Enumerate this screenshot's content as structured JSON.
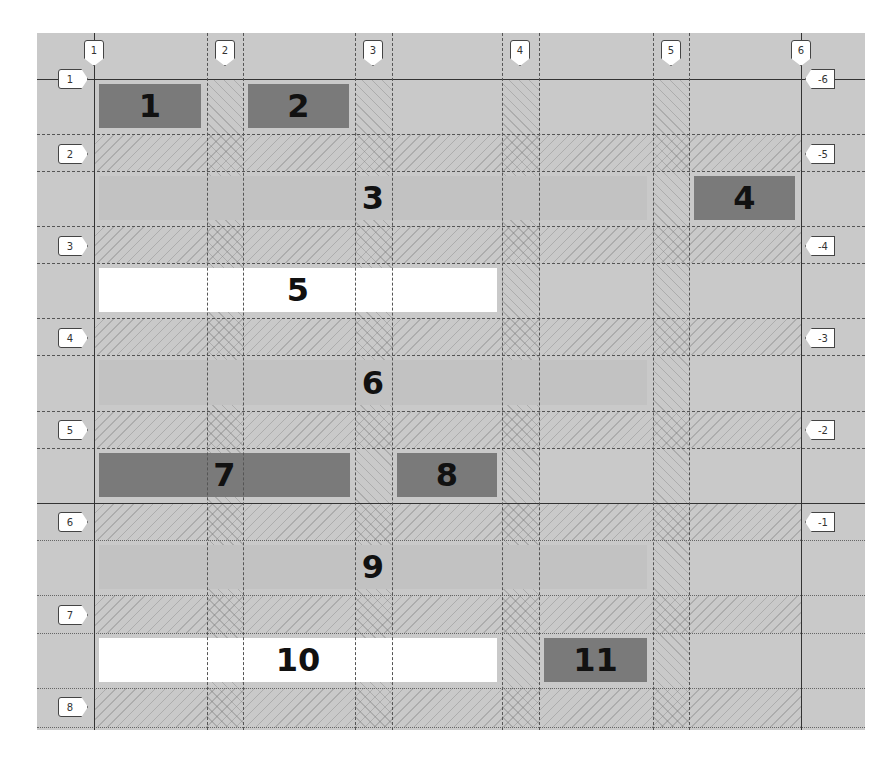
{
  "inspector": {
    "title": "CSS Grid Inspector Overlay",
    "column_line_labels": [
      "1",
      "2",
      "3",
      "4",
      "5",
      "6"
    ],
    "row_line_labels": [
      "1",
      "2",
      "3",
      "4",
      "5",
      "6",
      "7",
      "8"
    ],
    "negative_row_line_labels": [
      "-6",
      "-5",
      "-4",
      "-3",
      "-2",
      "-1"
    ]
  },
  "grid_items": [
    {
      "label": "1",
      "tone": "dark"
    },
    {
      "label": "2",
      "tone": "dark"
    },
    {
      "label": "3",
      "tone": "mid"
    },
    {
      "label": "4",
      "tone": "dark"
    },
    {
      "label": "5",
      "tone": "light"
    },
    {
      "label": "6",
      "tone": "mid"
    },
    {
      "label": "7",
      "tone": "dark"
    },
    {
      "label": "8",
      "tone": "dark"
    },
    {
      "label": "9",
      "tone": "mid"
    },
    {
      "label": "10",
      "tone": "light"
    },
    {
      "label": "11",
      "tone": "dark"
    }
  ],
  "colors": {
    "background": "#c9c9c9",
    "item_dark": "#7a7a7a",
    "item_mid": "#c2c2c2",
    "item_light": "#ffffff",
    "grid_line": "#333333"
  }
}
